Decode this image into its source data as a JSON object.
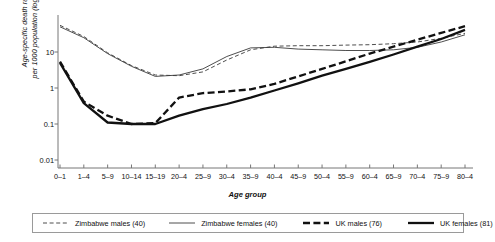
{
  "chart_data": {
    "type": "line",
    "title": "",
    "xlabel": "Age group",
    "ylabel": "Age-specific death rates\nper 1000 population (log scale)",
    "log_y": true,
    "grid": false,
    "legend_position": "bottom",
    "categories": [
      "0–1",
      "1–4",
      "5–9",
      "10–14",
      "15–19",
      "20–4",
      "25–9",
      "30–4",
      "35–9",
      "40–4",
      "45–9",
      "50–4",
      "55–9",
      "60–4",
      "65–9",
      "70–4",
      "75–9",
      "80–4"
    ],
    "ytick_labels": [
      "10",
      "1",
      "0.1",
      "0.01"
    ],
    "ytick_values": [
      10,
      1,
      0.1,
      0.01
    ],
    "ylim": [
      0.01,
      100
    ],
    "series": [
      {
        "name": "Zimbabwe males (40)",
        "style": "thin-dashed",
        "color": "#3a3a3a",
        "width": 0.9,
        "dash": "4,2.6",
        "values": [
          55,
          27,
          9.5,
          4.2,
          2.3,
          2.2,
          2.8,
          6.0,
          11.5,
          14.5,
          15.0,
          15.0,
          15.5,
          16.0,
          17.0,
          19.0,
          24.0,
          33.0
        ]
      },
      {
        "name": "Zimbabwe females (40)",
        "style": "thin-solid",
        "color": "#3a3a3a",
        "width": 0.9,
        "dash": "",
        "values": [
          50,
          25,
          9.0,
          4.0,
          2.1,
          2.3,
          3.4,
          7.5,
          13.0,
          13.5,
          12.0,
          11.5,
          11.0,
          11.0,
          11.5,
          13.5,
          19.0,
          30.0
        ]
      },
      {
        "name": "UK males (76)",
        "style": "thick-dashed",
        "color": "#111111",
        "width": 2.3,
        "dash": "7,3.4",
        "values": [
          5.4,
          0.42,
          0.17,
          0.1,
          0.105,
          0.54,
          0.72,
          0.8,
          0.92,
          1.3,
          2.1,
          3.4,
          5.5,
          9.0,
          14.0,
          22.0,
          34.0,
          52.0
        ]
      },
      {
        "name": "UK females (81)",
        "style": "thick-solid",
        "color": "#111111",
        "width": 2.3,
        "dash": "",
        "values": [
          5.0,
          0.38,
          0.11,
          0.1,
          0.1,
          0.17,
          0.26,
          0.36,
          0.54,
          0.85,
          1.35,
          2.2,
          3.4,
          5.3,
          8.5,
          14.0,
          23.0,
          41.0
        ]
      }
    ]
  },
  "legend": {
    "items": [
      {
        "label": "Zimbabwe males (40)"
      },
      {
        "label": "Zimbabwe females (40)"
      },
      {
        "label": "UK males (76)"
      },
      {
        "label": "UK females (81)"
      }
    ]
  }
}
